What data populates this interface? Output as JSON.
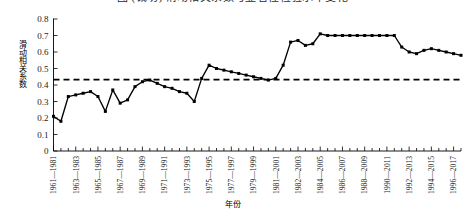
{
  "figure": {
    "title_partial": "图 (裁切) 滑动相关系数与显著性检验水平变化",
    "ylabel": "滑动相关系数",
    "xlabel": "年份"
  },
  "chart_data": {
    "type": "line",
    "title": "",
    "xlabel": "年份",
    "ylabel": "滑动相关系数",
    "ylim": [
      0,
      0.8
    ],
    "yticks": [
      "0",
      "0.1",
      "0.2",
      "0.3",
      "0.4",
      "0.5",
      "0.6",
      "0.7",
      "0.8"
    ],
    "ytick_values": [
      0,
      0.1,
      0.2,
      0.3,
      0.4,
      0.5,
      0.6,
      0.7,
      0.8
    ],
    "grid": false,
    "legend": "none",
    "marker": "filled-square",
    "line_color": "#000000",
    "threshold": {
      "label": "",
      "value": 0.433,
      "style": "dashed",
      "color": "#000000"
    },
    "xtick_labels": [
      "1961—1981",
      "1963—1983",
      "1965—1985",
      "1967—1987",
      "1969—1989",
      "1971—1991",
      "1973—1993",
      "1975—1995",
      "1977—1997",
      "1979—1999",
      "1981—2001",
      "1982—2003",
      "1984—2005",
      "1986—2007",
      "1988—2009",
      "1990—2011",
      "1992—2013",
      "1994—2015",
      "1996—2017"
    ],
    "xtick_indices": [
      0,
      3,
      6,
      9,
      12,
      15,
      18,
      21,
      24,
      27,
      30,
      33,
      36,
      39,
      42,
      45,
      48,
      51,
      54
    ],
    "x": [
      "1961—1981",
      "1962—1982",
      "1963—1983",
      "1964—1984",
      "1965—1985",
      "1966—1986",
      "1967—1987",
      "1968—1988",
      "1969—1989",
      "1970—1990",
      "1971—1991",
      "1972—1992",
      "1973—1993",
      "1974—1994",
      "1975—1995",
      "1976—1996",
      "1977—1997",
      "1978—1998",
      "1979—1999",
      "1980—2000",
      "1981—2001",
      "1982—2002",
      "1983—2003",
      "1984—2004",
      "1985—2005",
      "1986—2006",
      "1987—2007",
      "1988—2008",
      "1989—2009",
      "1990—2010",
      "1991—2011",
      "1992—2012",
      "1993—2013",
      "1994—2014",
      "1995—2015",
      "1996—2016",
      "1997—2017",
      "1998—2018",
      "1999—2019",
      "2000—2020",
      "2001—2021",
      "2002—2022",
      "2003—2023",
      "2004—2024",
      "2005—2025",
      "2006—2026",
      "2007—2027",
      "2008—2028",
      "2009—2029",
      "2010—2030",
      "2011—2031",
      "2012—2032",
      "2013—2033",
      "2014—2034",
      "2015—2035",
      "2016—2036"
    ],
    "values": [
      0.21,
      0.18,
      0.33,
      0.34,
      0.35,
      0.36,
      0.33,
      0.24,
      0.37,
      0.29,
      0.31,
      0.39,
      0.42,
      0.43,
      0.41,
      0.39,
      0.38,
      0.36,
      0.35,
      0.3,
      0.44,
      0.52,
      0.5,
      0.49,
      0.48,
      0.47,
      0.46,
      0.45,
      0.44,
      0.43,
      0.44,
      0.52,
      0.66,
      0.67,
      0.64,
      0.65,
      0.71,
      0.7,
      0.7,
      0.7,
      0.7,
      0.7,
      0.7,
      0.7,
      0.7,
      0.7,
      0.7,
      0.63,
      0.6,
      0.59,
      0.61,
      0.62,
      0.61,
      0.6,
      0.59,
      0.58
    ]
  }
}
